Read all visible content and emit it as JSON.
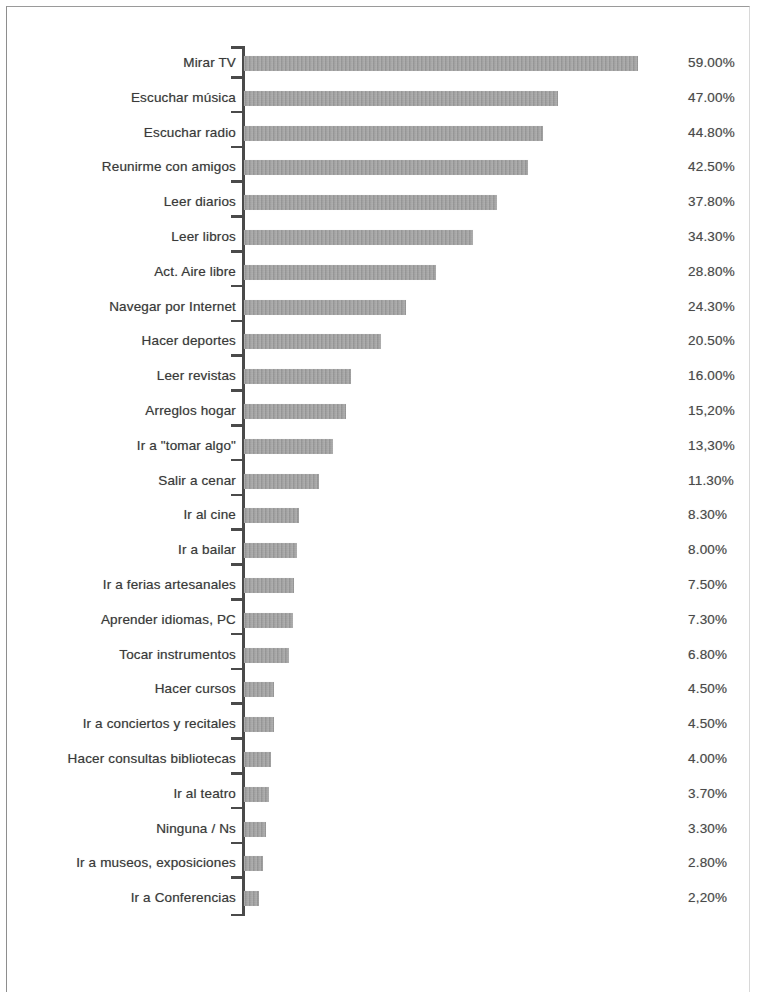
{
  "chart_data": {
    "type": "bar",
    "orientation": "horizontal",
    "title": "",
    "subtitle": "",
    "xlabel": "",
    "ylabel": "",
    "grid": false,
    "legend": null,
    "xlim": [
      0,
      59
    ],
    "value_suffix": "%",
    "categories": [
      "Mirar TV",
      "Escuchar música",
      "Escuchar radio",
      "Reunirme con amigos",
      "Leer diarios",
      "Leer libros",
      "Act. Aire libre",
      "Navegar por Internet",
      "Hacer deportes",
      "Leer revistas",
      "Arreglos hogar",
      "Ir a \"tomar algo\"",
      "Salir a cenar",
      "Ir al cine",
      "Ir a bailar",
      "Ir a ferias artesanales",
      "Aprender idiomas, PC",
      "Tocar instrumentos",
      "Hacer cursos",
      "Ir a conciertos y recitales",
      "Hacer consultas bibliotecas",
      "Ir al teatro",
      "Ninguna / Ns",
      "Ir a museos, exposiciones",
      "Ir a Conferencias"
    ],
    "values": [
      59.0,
      47.0,
      44.8,
      42.5,
      37.8,
      34.3,
      28.8,
      24.3,
      20.5,
      16.0,
      15.2,
      13.3,
      11.3,
      8.3,
      8.0,
      7.5,
      7.3,
      6.8,
      4.5,
      4.5,
      4.0,
      3.7,
      3.3,
      2.8,
      2.2
    ],
    "value_labels": [
      "59.00%",
      "47.00%",
      "44.80%",
      "42.50%",
      "37.80%",
      "34.30%",
      "28.80%",
      "24.30%",
      "20.50%",
      "16.00%",
      "15,20%",
      "13,30%",
      "11.30%",
      "8.30%",
      "8.00%",
      "7.50%",
      "7.30%",
      "6.80%",
      "4.50%",
      "4.50%",
      "4.00%",
      "3.70%",
      "3.30%",
      "2.80%",
      "2,20%"
    ],
    "bar_color": "#9a9a9a",
    "axis_color": "#4a4a4a",
    "text_color": "#3a3a3a"
  }
}
